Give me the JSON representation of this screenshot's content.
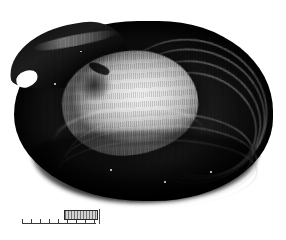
{
  "figure": {
    "kind": "halftone-photographic-plate",
    "background_color": "#ffffff",
    "subject_label": "fossil bivalve shell interior",
    "caption": ""
  },
  "specimen": {
    "name": "bivalve-shell",
    "orientation": "interior view, beak at upper left",
    "tone_range": "black to light grey halftone",
    "features": [
      {
        "name": "umbo-beak",
        "label": "beak / umbo",
        "position": "upper left"
      },
      {
        "name": "muscle-scar",
        "label": "adductor muscle scar",
        "position": "upper left of interior"
      },
      {
        "name": "pallial-line",
        "label": "pallial line",
        "position": "lower interior arc"
      },
      {
        "name": "growth-ridges",
        "label": "concentric growth ridges",
        "position": "right flank",
        "count": 7
      },
      {
        "name": "ventral-margin",
        "label": "ventral margin",
        "position": "lower edge"
      }
    ]
  },
  "scale_bar": {
    "name": "scale-bar",
    "tick_count": 9,
    "tick_values": [
      "",
      "",
      "",
      "",
      "",
      "",
      "",
      "",
      ""
    ],
    "unit_label": "",
    "marker_box_label": "",
    "end_bar_label": "",
    "line_color": "#3a3a3a",
    "marker_fill": "#b9b9b9"
  }
}
